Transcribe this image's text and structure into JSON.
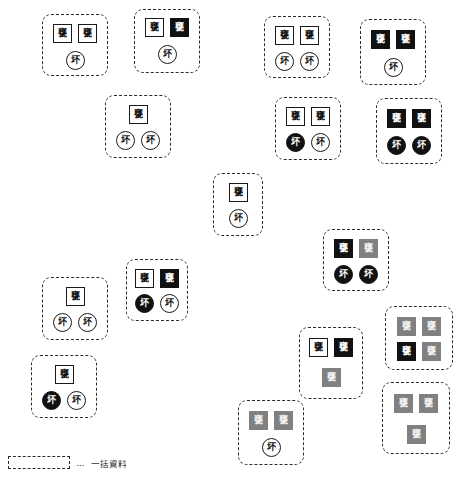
{
  "figure": {
    "title": "",
    "token_labels": {
      "square": "甕",
      "circle": "坏"
    },
    "colors": {
      "outline": "#2b2b2b",
      "black_fill": "#111111",
      "gray_fill": "#808080",
      "white_fill": "#ffffff"
    }
  },
  "legend": {
    "dots": "…",
    "label": "一括資料"
  },
  "groups": [
    {
      "id": "group-1",
      "x": 42,
      "y": 14,
      "w": 66,
      "h": 62,
      "rows": [
        {
          "y": 9,
          "items": [
            {
              "shape": "square",
              "fill": "white",
              "label": "甕"
            },
            {
              "shape": "square",
              "fill": "white",
              "label": "甕"
            }
          ]
        },
        {
          "y": 36,
          "items": [
            {
              "shape": "circle",
              "fill": "white",
              "label": "坏"
            }
          ]
        }
      ]
    },
    {
      "id": "group-2",
      "x": 134,
      "y": 9,
      "w": 66,
      "h": 64,
      "rows": [
        {
          "y": 8,
          "items": [
            {
              "shape": "square",
              "fill": "white",
              "label": "甕"
            },
            {
              "shape": "square",
              "fill": "black",
              "label": "甕"
            }
          ]
        },
        {
          "y": 35,
          "items": [
            {
              "shape": "circle",
              "fill": "white",
              "label": "坏"
            }
          ]
        }
      ]
    },
    {
      "id": "group-3",
      "x": 105,
      "y": 95,
      "w": 66,
      "h": 63,
      "rows": [
        {
          "y": 9,
          "items": [
            {
              "shape": "square",
              "fill": "white",
              "label": "甕"
            }
          ]
        },
        {
          "y": 35,
          "items": [
            {
              "shape": "circle",
              "fill": "white",
              "label": "坏"
            },
            {
              "shape": "circle",
              "fill": "white",
              "label": "坏"
            }
          ]
        }
      ]
    },
    {
      "id": "group-4",
      "x": 264,
      "y": 16,
      "w": 66,
      "h": 62,
      "rows": [
        {
          "y": 9,
          "items": [
            {
              "shape": "square",
              "fill": "white",
              "label": "甕"
            },
            {
              "shape": "square",
              "fill": "white",
              "label": "甕"
            }
          ]
        },
        {
          "y": 35,
          "items": [
            {
              "shape": "circle",
              "fill": "white",
              "label": "坏"
            },
            {
              "shape": "circle",
              "fill": "white",
              "label": "坏"
            }
          ]
        }
      ]
    },
    {
      "id": "group-5",
      "x": 360,
      "y": 19,
      "w": 66,
      "h": 66,
      "rows": [
        {
          "y": 10,
          "items": [
            {
              "shape": "square",
              "fill": "black",
              "label": "甕"
            },
            {
              "shape": "square",
              "fill": "black",
              "label": "甕"
            }
          ]
        },
        {
          "y": 38,
          "items": [
            {
              "shape": "circle",
              "fill": "white",
              "label": "坏"
            }
          ]
        }
      ]
    },
    {
      "id": "group-6",
      "x": 275,
      "y": 97,
      "w": 66,
      "h": 63,
      "rows": [
        {
          "y": 9,
          "items": [
            {
              "shape": "square",
              "fill": "white",
              "label": "甕"
            },
            {
              "shape": "square",
              "fill": "white",
              "label": "甕"
            }
          ]
        },
        {
          "y": 35,
          "items": [
            {
              "shape": "circle",
              "fill": "black",
              "label": "坏"
            },
            {
              "shape": "circle",
              "fill": "white",
              "label": "坏"
            }
          ]
        }
      ]
    },
    {
      "id": "group-7",
      "x": 376,
      "y": 98,
      "w": 66,
      "h": 66,
      "rows": [
        {
          "y": 10,
          "items": [
            {
              "shape": "square",
              "fill": "black",
              "label": "甕"
            },
            {
              "shape": "square",
              "fill": "black",
              "label": "甕"
            }
          ]
        },
        {
          "y": 37,
          "items": [
            {
              "shape": "circle",
              "fill": "black",
              "label": "坏"
            },
            {
              "shape": "circle",
              "fill": "black",
              "label": "坏"
            }
          ]
        }
      ]
    },
    {
      "id": "group-8",
      "x": 213,
      "y": 173,
      "w": 50,
      "h": 63,
      "rows": [
        {
          "y": 9,
          "items": [
            {
              "shape": "square",
              "fill": "white",
              "label": "甕"
            }
          ]
        },
        {
          "y": 35,
          "items": [
            {
              "shape": "circle",
              "fill": "white",
              "label": "坏"
            }
          ]
        }
      ]
    },
    {
      "id": "group-9",
      "x": 323,
      "y": 229,
      "w": 66,
      "h": 62,
      "rows": [
        {
          "y": 9,
          "items": [
            {
              "shape": "square",
              "fill": "black",
              "label": "甕"
            },
            {
              "shape": "square",
              "fill": "gray",
              "label": "甕"
            }
          ]
        },
        {
          "y": 35,
          "items": [
            {
              "shape": "circle",
              "fill": "black",
              "label": "坏"
            },
            {
              "shape": "circle",
              "fill": "black",
              "label": "坏"
            }
          ]
        }
      ]
    },
    {
      "id": "group-10",
      "x": 126,
      "y": 259,
      "w": 62,
      "h": 62,
      "rows": [
        {
          "y": 9,
          "items": [
            {
              "shape": "square",
              "fill": "white",
              "label": "甕"
            },
            {
              "shape": "square",
              "fill": "black",
              "label": "甕"
            }
          ]
        },
        {
          "y": 34,
          "items": [
            {
              "shape": "circle",
              "fill": "black",
              "label": "坏"
            },
            {
              "shape": "circle",
              "fill": "white",
              "label": "坏"
            }
          ]
        }
      ]
    },
    {
      "id": "group-11",
      "x": 42,
      "y": 277,
      "w": 66,
      "h": 63,
      "rows": [
        {
          "y": 9,
          "items": [
            {
              "shape": "square",
              "fill": "white",
              "label": "甕"
            }
          ]
        },
        {
          "y": 35,
          "items": [
            {
              "shape": "circle",
              "fill": "white",
              "label": "坏"
            },
            {
              "shape": "circle",
              "fill": "white",
              "label": "坏"
            }
          ]
        }
      ]
    },
    {
      "id": "group-12",
      "x": 31,
      "y": 355,
      "w": 66,
      "h": 63,
      "rows": [
        {
          "y": 9,
          "items": [
            {
              "shape": "square",
              "fill": "white",
              "label": "甕"
            }
          ]
        },
        {
          "y": 35,
          "items": [
            {
              "shape": "circle",
              "fill": "black",
              "label": "坏"
            },
            {
              "shape": "circle",
              "fill": "white",
              "label": "坏"
            }
          ]
        }
      ]
    },
    {
      "id": "group-13",
      "x": 299,
      "y": 327,
      "w": 64,
      "h": 72,
      "rows": [
        {
          "y": 10,
          "items": [
            {
              "shape": "square",
              "fill": "white",
              "label": "甕"
            },
            {
              "shape": "square",
              "fill": "black",
              "label": "甕"
            }
          ]
        },
        {
          "y": 40,
          "items": [
            {
              "shape": "square",
              "fill": "gray",
              "label": "甕"
            }
          ]
        }
      ]
    },
    {
      "id": "group-14",
      "x": 385,
      "y": 306,
      "w": 68,
      "h": 64,
      "rows": [
        {
          "y": 10,
          "items": [
            {
              "shape": "square",
              "fill": "gray",
              "label": "甕"
            },
            {
              "shape": "square",
              "fill": "gray",
              "label": "甕"
            }
          ]
        },
        {
          "y": 35,
          "items": [
            {
              "shape": "square",
              "fill": "black",
              "label": "甕"
            },
            {
              "shape": "square",
              "fill": "gray",
              "label": "甕"
            }
          ]
        }
      ]
    },
    {
      "id": "group-15",
      "x": 382,
      "y": 382,
      "w": 68,
      "h": 72,
      "rows": [
        {
          "y": 11,
          "items": [
            {
              "shape": "square",
              "fill": "gray",
              "label": "甕"
            },
            {
              "shape": "square",
              "fill": "gray",
              "label": "甕"
            }
          ]
        },
        {
          "y": 42,
          "items": [
            {
              "shape": "square",
              "fill": "gray",
              "label": "甕"
            }
          ]
        }
      ]
    },
    {
      "id": "group-16",
      "x": 238,
      "y": 400,
      "w": 66,
      "h": 65,
      "rows": [
        {
          "y": 10,
          "items": [
            {
              "shape": "square",
              "fill": "gray",
              "label": "甕"
            },
            {
              "shape": "square",
              "fill": "gray",
              "label": "甕"
            }
          ]
        },
        {
          "y": 37,
          "items": [
            {
              "shape": "circle",
              "fill": "white",
              "label": "坏"
            }
          ]
        }
      ]
    }
  ]
}
